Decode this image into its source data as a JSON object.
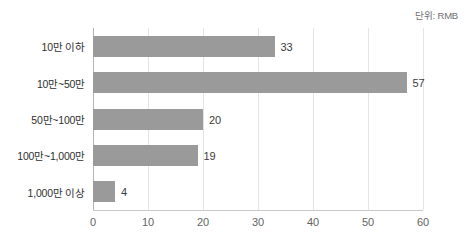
{
  "annotation": {
    "unit_note": "단위: RMB"
  },
  "chart_data": {
    "type": "bar",
    "orientation": "horizontal",
    "title": "",
    "subtitle": "",
    "xlabel": "",
    "ylabel": "",
    "unit_note": "단위: RMB",
    "categories": [
      "10만 이하",
      "10만~50만",
      "50만~100만",
      "100만~1,000만",
      "1,000만 이상"
    ],
    "values": [
      33,
      57,
      20,
      19,
      4
    ],
    "value_labels": [
      "33",
      "57",
      "20",
      "19",
      "4"
    ],
    "xlim": [
      0,
      60
    ],
    "xticks": [
      0,
      10,
      20,
      30,
      40,
      50,
      60
    ],
    "xtick_labels": [
      "0",
      "10",
      "20",
      "30",
      "40",
      "50",
      "60"
    ],
    "grid": "vertical",
    "legend": "none",
    "bar_color": "#9a9a9a",
    "gridline_color": "#e4e4e4",
    "axis_color": "#b4b4b4",
    "background_color": "#ffffff"
  }
}
